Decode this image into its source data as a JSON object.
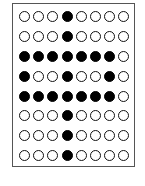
{
  "grid": {
    "rows": 8,
    "cols": 8,
    "cells": [
      [
        0,
        0,
        0,
        1,
        0,
        0,
        0,
        0
      ],
      [
        0,
        0,
        0,
        1,
        0,
        0,
        0,
        0
      ],
      [
        1,
        1,
        1,
        1,
        1,
        1,
        1,
        0
      ],
      [
        1,
        0,
        0,
        1,
        0,
        0,
        1,
        0
      ],
      [
        1,
        1,
        1,
        1,
        1,
        1,
        1,
        0
      ],
      [
        0,
        0,
        0,
        1,
        0,
        0,
        0,
        0
      ],
      [
        0,
        0,
        0,
        1,
        0,
        0,
        0,
        0
      ],
      [
        0,
        0,
        0,
        1,
        0,
        0,
        0,
        0
      ]
    ]
  },
  "colors": {
    "filled": "#000000",
    "empty": "#ffffff",
    "outline": "#111111",
    "frame": "#555555"
  }
}
